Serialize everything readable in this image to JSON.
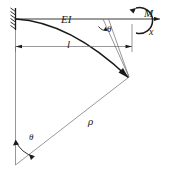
{
  "figure": {
    "labels": {
      "flexural_rigidity": "EI",
      "moment_symbol": "M",
      "moment_subscript": "e",
      "axis_x": "x",
      "length": "l",
      "radius": "ρ",
      "angle_top": "θ",
      "angle_bottom": "θ"
    },
    "colors": {
      "stroke": "#1a1a1a",
      "thin_stroke": "#6b6b6b",
      "background": "#ffffff"
    },
    "elements": {
      "fixed_support": "fixed-support-hatched-wall",
      "beam_axis": "undeformed-beam-axis",
      "deflected_curve": "deflected-beam-arc",
      "moment_arc": "applied-end-moment",
      "dimension_line": "length-dimension-l",
      "radius_line": "radius-rho-line",
      "vertical_line": "center-vertical-line",
      "angle_arc_top": "theta-arc-at-beam",
      "angle_arc_bottom": "theta-arc-at-center"
    }
  }
}
